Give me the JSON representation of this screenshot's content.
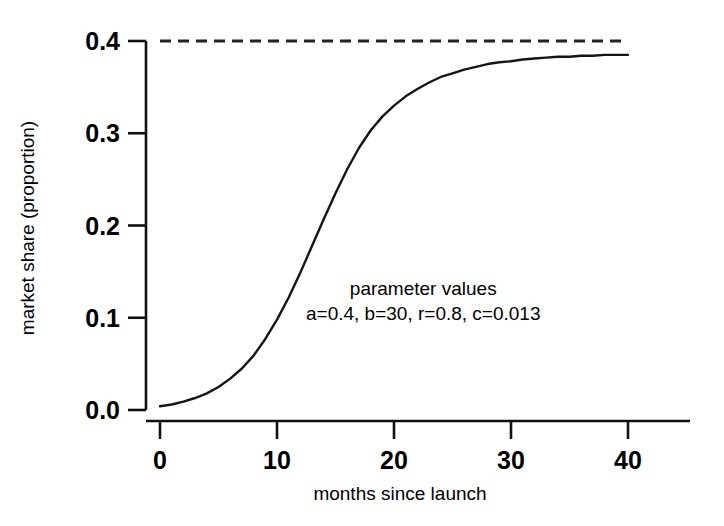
{
  "chart_data": {
    "type": "line",
    "title": "",
    "xlabel": "months since launch",
    "ylabel": "market share (proportion)",
    "xlim": [
      0,
      40
    ],
    "ylim": [
      0.0,
      0.4
    ],
    "xticks": [
      0,
      10,
      20,
      30,
      40
    ],
    "xtick_labels": [
      "0",
      "10",
      "20",
      "30",
      "40"
    ],
    "yticks": [
      0.0,
      0.1,
      0.2,
      0.3,
      0.4
    ],
    "ytick_labels": [
      "0.0",
      "0.1",
      "0.2",
      "0.3",
      "0.4"
    ],
    "grid": false,
    "legend": "none",
    "series": [
      {
        "name": "market share curve",
        "style": "solid",
        "color": "#151515",
        "x": [
          0,
          1,
          2,
          3,
          4,
          5,
          6,
          7,
          8,
          9,
          10,
          11,
          12,
          13,
          14,
          15,
          16,
          17,
          18,
          19,
          20,
          21,
          22,
          23,
          24,
          25,
          26,
          27,
          28,
          29,
          30,
          31,
          32,
          33,
          34,
          35,
          36,
          37,
          38,
          39,
          40
        ],
        "values": [
          0.004,
          0.006,
          0.009,
          0.013,
          0.018,
          0.025,
          0.034,
          0.045,
          0.059,
          0.077,
          0.098,
          0.122,
          0.149,
          0.178,
          0.207,
          0.235,
          0.261,
          0.284,
          0.303,
          0.318,
          0.33,
          0.34,
          0.348,
          0.355,
          0.361,
          0.365,
          0.369,
          0.372,
          0.375,
          0.377,
          0.378,
          0.38,
          0.381,
          0.382,
          0.383,
          0.383,
          0.384,
          0.384,
          0.385,
          0.385,
          0.385
        ]
      },
      {
        "name": "asymptote",
        "style": "dashed",
        "color": "#222222",
        "x": [
          0,
          40
        ],
        "values": [
          0.4,
          0.4
        ]
      }
    ],
    "annotations": [
      {
        "name": "parameter-values-heading",
        "text": "parameter values",
        "x": 22.5,
        "y": 0.125
      },
      {
        "name": "parameter-values-line",
        "text": "a=0.4, b=30, r=0.8, c=0.013",
        "x": 22.5,
        "y": 0.098
      }
    ]
  }
}
